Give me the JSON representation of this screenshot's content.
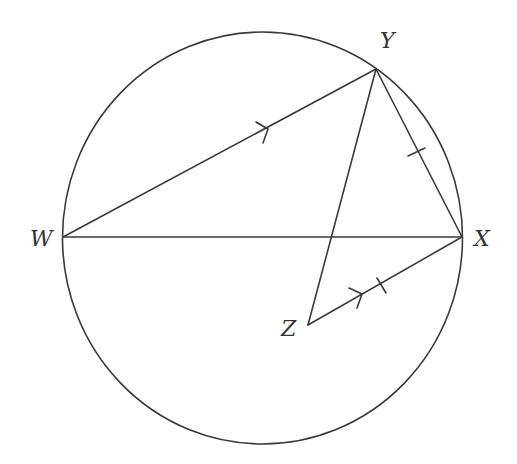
{
  "diagram": {
    "type": "geometry-circle",
    "circle": {
      "cx": 262.5,
      "cy": 238,
      "rx": 200,
      "ry": 206
    },
    "points": {
      "W": {
        "label": "W",
        "x": 63,
        "y": 237,
        "label_x": 30,
        "label_y": 246
      },
      "X": {
        "label": "X",
        "x": 462,
        "y": 237,
        "label_x": 474,
        "label_y": 246
      },
      "Y": {
        "label": "Y",
        "x": 376,
        "y": 69,
        "label_x": 380,
        "label_y": 48
      },
      "Z": {
        "label": "Z",
        "x": 308,
        "y": 325,
        "label_x": 281,
        "label_y": 336
      }
    },
    "segments": [
      {
        "from": "W",
        "to": "Y",
        "marker": "arrow"
      },
      {
        "from": "W",
        "to": "X",
        "marker": "none"
      },
      {
        "from": "Y",
        "to": "X",
        "marker": "tick"
      },
      {
        "from": "Y",
        "to": "Z",
        "marker": "none"
      },
      {
        "from": "Z",
        "to": "X",
        "marker": "arrow+tick"
      }
    ],
    "stroke_color": "#3a3a3a"
  }
}
